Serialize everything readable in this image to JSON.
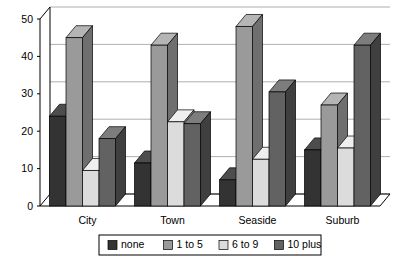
{
  "chart_data": {
    "type": "bar",
    "title": "",
    "subtitle": "",
    "xlabel": "",
    "ylabel": "",
    "categories": [
      "City",
      "Town",
      "Seaside",
      "Suburb"
    ],
    "series": [
      {
        "name": "none",
        "color": "#333333",
        "side_color": "#1f1f1f",
        "top_color": "#4d4d4d",
        "values": [
          24,
          11.5,
          7,
          15
        ]
      },
      {
        "name": "1 to 5",
        "color": "#9a9a9a",
        "side_color": "#6f6f6f",
        "top_color": "#b5b5b5",
        "values": [
          45,
          43,
          48,
          27
        ]
      },
      {
        "name": "6 to 9",
        "color": "#dcdcdc",
        "side_color": "#a8a8a8",
        "top_color": "#efefef",
        "values": [
          9.5,
          22.5,
          12.5,
          15.5
        ]
      },
      {
        "name": "10 plus",
        "color": "#626262",
        "side_color": "#3f3f3f",
        "top_color": "#7d7d7d",
        "values": [
          18,
          22,
          30.5,
          43
        ]
      }
    ],
    "ylim": [
      0,
      50
    ],
    "ytick_values": [
      0,
      10,
      20,
      30,
      40,
      50
    ],
    "ytick_labels": [
      "0",
      "10",
      "20",
      "30",
      "40",
      "50"
    ],
    "grid": true,
    "legend_position": "bottom",
    "legend_entries": [
      "none",
      "1 to 5",
      "6 to 9",
      "10 plus"
    ],
    "style": "3d-clustered-column"
  },
  "axis": {
    "y_max_label": "50",
    "y_min_label": "0"
  }
}
